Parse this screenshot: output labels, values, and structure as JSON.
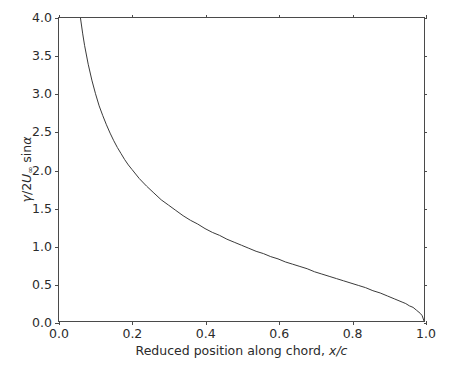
{
  "chart_data": {
    "type": "line",
    "title": "",
    "xlabel": "Reduced position along chord, x/c",
    "ylabel": "γ/2U∞ sinα",
    "xlabel_parts": {
      "text": "Reduced position along chord, ",
      "math": "x/c"
    },
    "ylabel_parts": {
      "gamma": "γ",
      "slash": "/2",
      "u": "U",
      "sub": "∞",
      "trig": " sin",
      "alpha": "α"
    },
    "xlim": [
      0.0,
      1.0
    ],
    "ylim": [
      0.0,
      4.0
    ],
    "xticks": [
      0.0,
      0.2,
      0.4,
      0.6,
      0.8,
      1.0
    ],
    "xticklabels": [
      "0.0",
      "0.2",
      "0.4",
      "0.6",
      "0.8",
      "1.0"
    ],
    "yticks": [
      0.0,
      0.5,
      1.0,
      1.5,
      2.0,
      2.5,
      3.0,
      3.5,
      4.0
    ],
    "yticklabels": [
      "0.0",
      "0.5",
      "1.0",
      "1.5",
      "2.0",
      "2.5",
      "3.0",
      "3.5",
      "4.0"
    ],
    "grid": false,
    "legend": null,
    "line_color": "#3b3b3b",
    "line_width": 1.0,
    "series": [
      {
        "name": "gamma distribution",
        "formula": "sqrt((1 - x/c)/(x/c))",
        "x": [
          0.0588,
          0.065,
          0.07,
          0.08,
          0.09,
          0.1,
          0.11,
          0.12,
          0.13,
          0.14,
          0.15,
          0.16,
          0.17,
          0.18,
          0.19,
          0.2,
          0.22,
          0.24,
          0.26,
          0.28,
          0.3,
          0.32,
          0.34,
          0.36,
          0.38,
          0.4,
          0.42,
          0.44,
          0.46,
          0.48,
          0.5,
          0.52,
          0.54,
          0.56,
          0.58,
          0.6,
          0.62,
          0.64,
          0.66,
          0.68,
          0.7,
          0.72,
          0.74,
          0.76,
          0.78,
          0.8,
          0.82,
          0.84,
          0.86,
          0.88,
          0.9,
          0.92,
          0.94,
          0.95,
          0.96,
          0.97,
          0.98,
          0.99,
          0.995,
          1.0
        ],
        "y": [
          4.0,
          3.79,
          3.64,
          3.39,
          3.18,
          3.0,
          2.84,
          2.71,
          2.59,
          2.48,
          2.38,
          2.29,
          2.21,
          2.13,
          2.06,
          2.0,
          1.88,
          1.78,
          1.69,
          1.6,
          1.53,
          1.46,
          1.39,
          1.33,
          1.28,
          1.22,
          1.17,
          1.13,
          1.08,
          1.04,
          1.0,
          0.96,
          0.92,
          0.89,
          0.85,
          0.82,
          0.78,
          0.75,
          0.72,
          0.69,
          0.65,
          0.62,
          0.59,
          0.56,
          0.53,
          0.5,
          0.47,
          0.44,
          0.4,
          0.37,
          0.33,
          0.29,
          0.25,
          0.23,
          0.2,
          0.18,
          0.14,
          0.1,
          0.07,
          0.0
        ]
      }
    ],
    "annotations": []
  }
}
